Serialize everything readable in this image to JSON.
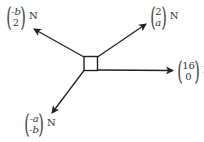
{
  "diagram": {
    "type": "force-diagram",
    "object": "particle (square)",
    "unit": "N",
    "forces": [
      {
        "id": "top-left",
        "top": "-b",
        "bottom": "2",
        "direction": "up-left"
      },
      {
        "id": "top-right",
        "top": "2",
        "bottom": "a",
        "direction": "up-right"
      },
      {
        "id": "right",
        "top": "16",
        "bottom": "0",
        "direction": "right"
      },
      {
        "id": "bottom-left",
        "top": "-a",
        "bottom": "-b",
        "direction": "down-left"
      }
    ]
  }
}
